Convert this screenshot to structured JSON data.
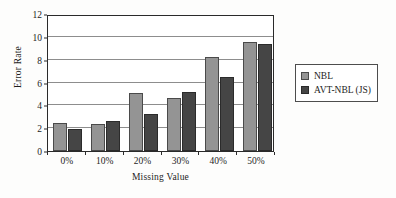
{
  "chart_data": {
    "type": "bar",
    "title": "",
    "xlabel": "Missing Value",
    "ylabel": "Error Rate",
    "categories": [
      "0%",
      "10%",
      "20%",
      "30%",
      "40%",
      "50%"
    ],
    "series": [
      {
        "name": "NBL",
        "color": "#949494",
        "values": [
          2.45,
          2.35,
          5.1,
          4.6,
          8.2,
          9.55
        ]
      },
      {
        "name": "AVT-NBL (JS)",
        "color": "#454545",
        "values": [
          1.95,
          2.6,
          3.2,
          5.2,
          6.5,
          9.4
        ]
      }
    ],
    "ylim": [
      0,
      12
    ],
    "yticks": [
      0,
      2,
      4,
      6,
      8,
      10,
      12
    ],
    "ytick_labels": [
      "0",
      "2",
      "4",
      "6",
      "8",
      "10",
      "12"
    ],
    "grid": true,
    "legend_position": "right"
  }
}
